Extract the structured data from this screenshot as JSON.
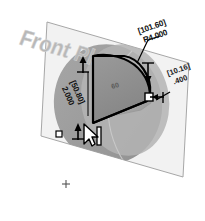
{
  "view": {
    "app_context": "cad-3d-sketch-view",
    "background_color": "#ffffff",
    "plane_label": "Front Plane",
    "plane_fill_color": "#f2f2f2",
    "plane_edge_color": "#9a9a9a",
    "shadow_blob_color": "#9c9c9c",
    "shadow_blob_highlight_color": "#b5b5b5",
    "sketch_line_color": "#000000",
    "sketch_fill_color": "#8e8e8e",
    "extrude_preview_color": "#a8a8a8",
    "origin_marker": "+"
  },
  "dimensions": [
    {
      "id": "radius-dim",
      "name": "arc-radius-dimension",
      "metric": "[101.60]",
      "imperial": "R4.000",
      "leader": "arc-top-right"
    },
    {
      "id": "height-dim",
      "name": "height-dimension",
      "metric": "[50.80]",
      "imperial": "2.000",
      "leader": "left-vertical-edge"
    },
    {
      "id": "thickness-dim",
      "name": "thickness-dimension",
      "metric": "[10.16]",
      "imperial": ".400",
      "leader": "right-edge"
    }
  ],
  "handles": {
    "top_handle_label": "arrow-handle-top",
    "right_handle_label": "arrow-handle-right",
    "vertex_handle_label": "square-vertex-handle",
    "bottom_handle_label": "arrow-handle-bottom",
    "selection_box_label": "selection-square"
  },
  "cursor": {
    "type": "arrow-pointer",
    "label": "mouse-cursor"
  },
  "faint_annotation": "60"
}
